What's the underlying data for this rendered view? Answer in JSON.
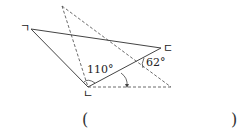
{
  "figure": {
    "vertices": {
      "a": {
        "label": "ㄱ",
        "x": 31,
        "y": 29
      },
      "b": {
        "label": "ㄴ",
        "x": 88,
        "y": 87
      },
      "c": {
        "label": "ㄷ",
        "x": 161,
        "y": 48
      }
    },
    "dashed_apex": {
      "x": 62,
      "y": 6
    },
    "dashed_right": {
      "x": 171,
      "y": 87
    },
    "angles": {
      "angle_b": "110°",
      "angle_fold": "62°"
    }
  },
  "answer": {
    "open_paren": "(",
    "close_paren": ")"
  }
}
